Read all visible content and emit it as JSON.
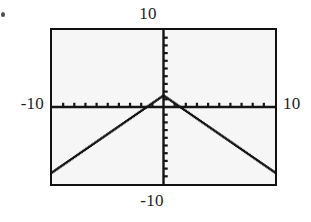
{
  "figure": {
    "kind": "graphing-calculator-screen",
    "background_color": "#ffffff",
    "frame_color": "#111111",
    "screen_fill": "#f6f6f6",
    "curve_color": "#151515"
  },
  "labels": {
    "top": "10",
    "bottom": "-10",
    "left": "-10",
    "right": "10"
  },
  "chart_data": {
    "type": "line",
    "title": "",
    "xlabel": "",
    "ylabel": "",
    "xlim": [
      -10,
      10
    ],
    "ylim": [
      -10,
      10
    ],
    "grid": false,
    "legend_position": "none",
    "axes": {
      "x_axis_at_y": 0,
      "y_axis_at_x": 0,
      "x_tick_step": 1,
      "y_tick_step": 1,
      "x_ticks": [
        -9,
        -8,
        -7,
        -6,
        -5,
        -4,
        -3,
        -2,
        -1,
        1,
        2,
        3,
        4,
        5,
        6,
        7,
        8,
        9
      ],
      "y_ticks": [
        -9,
        -8,
        -7,
        -6,
        -5,
        -4,
        -3,
        -2,
        -1,
        1,
        2,
        3,
        4,
        5,
        6,
        7,
        8,
        9
      ],
      "tick_label_text": {
        "x_min": "-10",
        "x_max": "10",
        "y_min": "-10",
        "y_max": "10"
      }
    },
    "annotations": [
      "vertex of inverted V at x = 0",
      "branches have slope -1 (right) and +1 (left)",
      "x-intercepts near x = -1.5 and x = 1.5"
    ],
    "series": [
      {
        "name": "y = -|x| + 1.5",
        "style": "dotted-pixel-trace",
        "vertex": [
          0,
          1.5
        ],
        "slope_left": 1,
        "slope_right": -1,
        "x": [
          -10,
          -9,
          -8,
          -7,
          -6,
          -5,
          -4,
          -3,
          -2,
          -1.5,
          -1,
          0,
          1,
          1.5,
          2,
          3,
          4,
          5,
          6,
          7,
          8,
          9,
          10
        ],
        "values": [
          -8.5,
          -7.5,
          -6.5,
          -5.5,
          -4.5,
          -3.5,
          -2.5,
          -1.5,
          -0.5,
          0,
          0.5,
          1.5,
          0.5,
          0,
          -0.5,
          -1.5,
          -2.5,
          -3.5,
          -4.5,
          -5.5,
          -6.5,
          -7.5,
          -8.5
        ]
      }
    ]
  }
}
